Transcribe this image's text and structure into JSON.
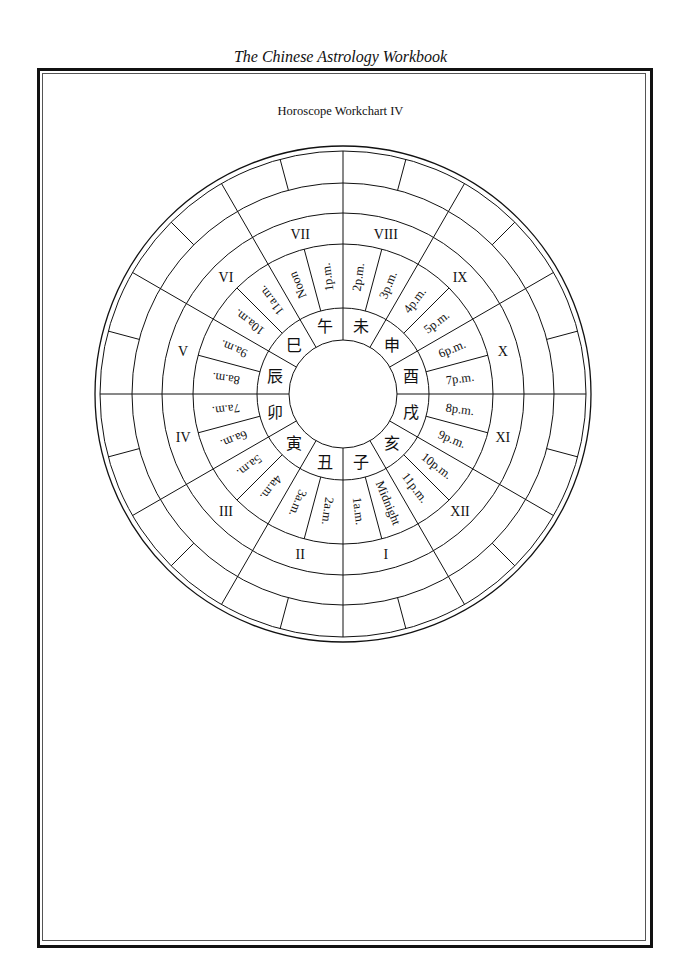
{
  "running_head": "The Chinese Astrology Workbook",
  "chart_title": "Horoscope Workchart IV",
  "wheel": {
    "center": [
      343,
      394
    ],
    "radii": {
      "outer": 248,
      "outer_double": 243,
      "box_inner": 211,
      "blank_inner": 181,
      "house_inner": 150,
      "hour_inner": 86,
      "branch_inner": 54
    },
    "houses": [
      "VIII",
      "IX",
      "X",
      "XI",
      "XII",
      "I",
      "II",
      "III",
      "IV",
      "V",
      "VI",
      "VII"
    ],
    "branches": [
      "未",
      "申",
      "酉",
      "戌",
      "亥",
      "子",
      "丑",
      "寅",
      "卯",
      "辰",
      "巳",
      "午"
    ],
    "hours": [
      "2p.m.",
      "3p.m.",
      "4p.m.",
      "5p.m.",
      "6p.m.",
      "7p.m.",
      "8p.m.",
      "9p.m.",
      "10p.m.",
      "11p.m.",
      "Midnight",
      "1a.m.",
      "2a.m.",
      "3a.m.",
      "4a.m.",
      "5a.m.",
      "6a.m.",
      "7a.m.",
      "8a.m.",
      "9a.m.",
      "10a.m.",
      "11a.m.",
      "Noon",
      "1p.m."
    ]
  },
  "colors": {
    "ink": "#111111",
    "paper": "#ffffff"
  }
}
